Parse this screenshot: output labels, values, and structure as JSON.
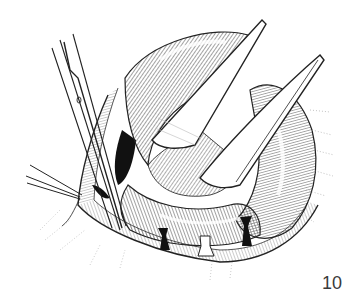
{
  "figure": {
    "number_label": "10"
  },
  "colors": {
    "ink": "#1a1a1a",
    "paper": "#ffffff",
    "shadow": "#111111"
  }
}
